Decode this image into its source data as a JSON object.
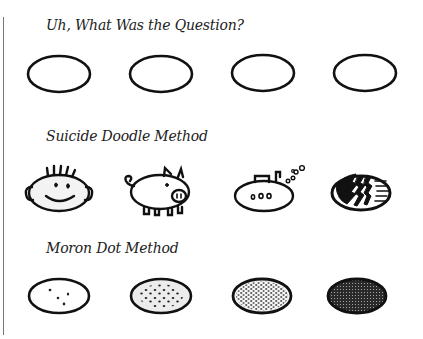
{
  "sections": [
    {
      "heading": "Uh, What Was the Question?",
      "items": [
        {
          "name": "empty-oval-1",
          "style": "plain"
        },
        {
          "name": "empty-oval-2",
          "style": "plain"
        },
        {
          "name": "empty-oval-3",
          "style": "plain"
        },
        {
          "name": "empty-oval-4",
          "style": "plain"
        }
      ]
    },
    {
      "heading": "Suicide Doodle Method",
      "items": [
        {
          "name": "smiley-face-doodle",
          "style": "face"
        },
        {
          "name": "pig-doodle",
          "style": "pig"
        },
        {
          "name": "submarine-doodle",
          "style": "submarine"
        },
        {
          "name": "zigzag-pattern-doodle",
          "style": "zigzag"
        }
      ]
    },
    {
      "heading": "Moron Dot Method",
      "items": [
        {
          "name": "sparse-dots-oval",
          "style": "dots-few"
        },
        {
          "name": "medium-dots-oval",
          "style": "dots-medium"
        },
        {
          "name": "dense-dots-oval",
          "style": "dots-dense"
        },
        {
          "name": "filled-dots-oval",
          "style": "dots-full"
        }
      ]
    }
  ],
  "colors": {
    "ink": "#111111",
    "margin_line": "#777777",
    "text": "#222222"
  }
}
